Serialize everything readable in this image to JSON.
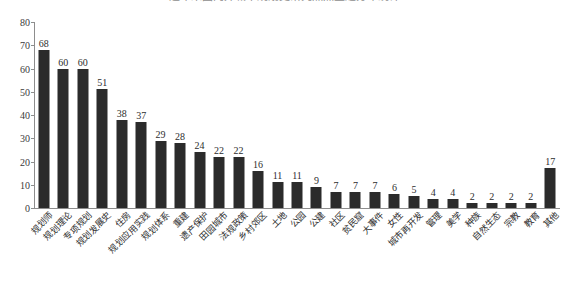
{
  "title": {
    "text": "近年来国内外城市规划史研究热点主题分布统计",
    "visible_clipped": true
  },
  "axis": {
    "y_ticks": [
      0,
      10,
      20,
      30,
      40,
      50,
      60,
      70,
      80
    ],
    "y_min": 0,
    "y_max": 80,
    "y_label": "",
    "x_label": ""
  },
  "colors": {
    "bar": "#2b2b2b",
    "axis": "#8d8d8d",
    "text": "#2d2d2d",
    "background": "#ffffff"
  },
  "chart_data": {
    "type": "bar",
    "title": "近年来国内外城市规划史研究热点主题分布统计",
    "xlabel": "",
    "ylabel": "",
    "ylim": [
      0,
      80
    ],
    "grid": false,
    "legend": false,
    "categories": [
      "规划师",
      "规划理论",
      "专项规划",
      "规划发展史",
      "住房",
      "规划应用实践",
      "规划体系",
      "重建",
      "遗产保护",
      "田园城市",
      "法规政策",
      "乡村郊区",
      "土地",
      "公园",
      "公建",
      "社区",
      "贫民窟",
      "大事件",
      "女性",
      "城市再开发",
      "管理",
      "美学",
      "种族",
      "自然生态",
      "宗教",
      "教育",
      "其他"
    ],
    "values": [
      68,
      60,
      60,
      51,
      38,
      37,
      29,
      28,
      24,
      22,
      22,
      16,
      11,
      11,
      9,
      7,
      7,
      7,
      6,
      5,
      4,
      4,
      2,
      2,
      2,
      2,
      17
    ]
  }
}
